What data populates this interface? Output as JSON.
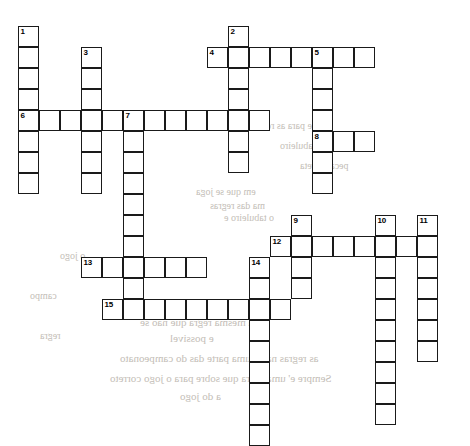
{
  "puzzle": {
    "title": "Crossword Puzzle Grid",
    "cell_size": 21,
    "grid_origin": {
      "x": 18,
      "y": 26
    },
    "ink_color": "#1a1a1a",
    "cell_fill": "#ffffff",
    "page_color": "#ffffff",
    "bleed_text_color": "#b9b3ab",
    "entries": [
      {
        "number": "1",
        "direction": "down",
        "col": 0,
        "row": 0,
        "length": 8
      },
      {
        "number": "2",
        "direction": "down",
        "col": 10,
        "row": 0,
        "length": 7
      },
      {
        "number": "3",
        "direction": "down",
        "col": 3,
        "row": 1,
        "length": 7
      },
      {
        "number": "4",
        "direction": "across",
        "col": 9,
        "row": 1,
        "length": 8
      },
      {
        "number": "5",
        "direction": "down",
        "col": 14,
        "row": 1,
        "length": 7
      },
      {
        "number": "6",
        "direction": "across",
        "col": 0,
        "row": 4,
        "length": 12
      },
      {
        "number": "7",
        "direction": "down",
        "col": 5,
        "row": 4,
        "length": 9
      },
      {
        "number": "8",
        "direction": "across",
        "col": 14,
        "row": 5,
        "length": 3
      },
      {
        "number": "9",
        "direction": "down",
        "col": 13,
        "row": 9,
        "length": 4
      },
      {
        "number": "10",
        "direction": "down",
        "col": 17,
        "row": 9,
        "length": 10
      },
      {
        "number": "11",
        "direction": "down",
        "col": 19,
        "row": 9,
        "length": 7
      },
      {
        "number": "12",
        "direction": "across",
        "col": 12,
        "row": 10,
        "length": 8
      },
      {
        "number": "13",
        "direction": "across",
        "col": 3,
        "row": 11,
        "length": 6
      },
      {
        "number": "14",
        "direction": "down",
        "col": 11,
        "row": 11,
        "length": 9
      },
      {
        "number": "15",
        "direction": "across",
        "col": 4,
        "row": 13,
        "length": 9
      }
    ],
    "numbers": [
      "1",
      "2",
      "3",
      "4",
      "5",
      "6",
      "7",
      "8",
      "9",
      "10",
      "11",
      "12",
      "13",
      "14",
      "15"
    ]
  },
  "bleed_through": {
    "lines": [
      {
        "text": "em que se joga",
        "x": 196,
        "y": 186,
        "size": 10
      },
      {
        "text": "ma das regras",
        "x": 210,
        "y": 200,
        "size": 10
      },
      {
        "text": "o tabuleiro e",
        "x": 224,
        "y": 212,
        "size": 10
      },
      {
        "text": "a sequencia",
        "x": 150,
        "y": 300,
        "size": 11
      },
      {
        "text": "a mesma regra que nao se",
        "x": 140,
        "y": 316,
        "size": 11
      },
      {
        "text": "e possivel",
        "x": 170,
        "y": 332,
        "size": 11
      },
      {
        "text": "as regras nao e uma parte das do campeonato",
        "x": 120,
        "y": 352,
        "size": 11
      },
      {
        "text": "Sempre e' uma regra que sobre para o jogo correto",
        "x": 110,
        "y": 372,
        "size": 11
      },
      {
        "text": "a do jogo",
        "x": 180,
        "y": 390,
        "size": 11
      },
      {
        "text": "e para as regras",
        "x": 250,
        "y": 120,
        "size": 10
      },
      {
        "text": "o tabuleiro",
        "x": 280,
        "y": 140,
        "size": 10
      },
      {
        "text": "peca correta",
        "x": 300,
        "y": 160,
        "size": 10
      },
      {
        "text": "o jogo",
        "x": 60,
        "y": 250,
        "size": 10
      },
      {
        "text": "regra",
        "x": 40,
        "y": 330,
        "size": 10
      },
      {
        "text": "campo",
        "x": 30,
        "y": 290,
        "size": 10
      }
    ]
  }
}
